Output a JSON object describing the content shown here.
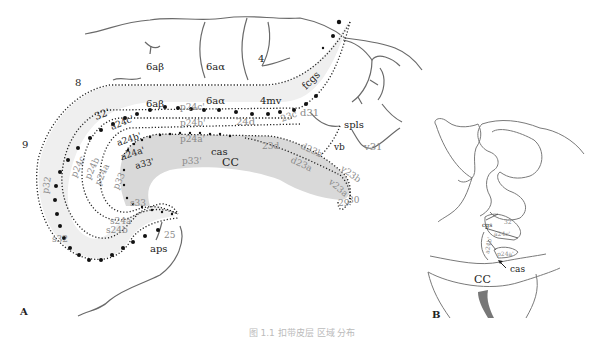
{
  "figure": {
    "panels": {
      "A": {
        "label": "A"
      },
      "B": {
        "label": "B"
      }
    },
    "colors": {
      "outline": "#6a6a6a",
      "dotted_border": "#222222",
      "shade_band": "#efefef",
      "cc_fill": "#d9d9d9",
      "dark_label": "#222222",
      "gray_label": "#8a8a8a",
      "ventricle": "#777777"
    },
    "panel_a_labels": {
      "area_8": "8",
      "area_9": "9",
      "area_6ab_top": "6aβ",
      "area_6aa_top": "6aα",
      "area_4": "4",
      "area_6ab_band": "6aβ",
      "area_6aa_band": "6aα",
      "area_4mv": "4mv",
      "fcgs": "fcgs",
      "area_32p": "32'",
      "a24c": "a24c'",
      "a24b": "a24b'",
      "a24a": "a24a'",
      "a33": "a33'",
      "p24c": "p24c'",
      "p24b": "p24b'",
      "p24a": "p24a'",
      "p33": "p33'",
      "area_24d": "24d",
      "area_23c": "23c",
      "area_23d": "23d",
      "d23b": "d23b",
      "d23a": "d23a",
      "v23b": "v23b",
      "v23a": "v23a",
      "area_29": "29",
      "area_30": "30",
      "d31": "d31",
      "v31": "v31",
      "spls": "spls",
      "vb": "vb",
      "cas": "cas",
      "cc": "CC",
      "p32": "p32",
      "p24c_v": "p24c",
      "p24b_v": "p24b",
      "p24a_v": "p24a",
      "p33_v": "p33",
      "s33": "s33",
      "s24a": "s24a",
      "s24b": "s24b",
      "s32": "s32",
      "area_25": "25",
      "aps": "aps"
    },
    "panel_b_labels": {
      "cgs": "cgs",
      "area_32p": "32'",
      "a24c": "a24c'",
      "a24b": "a24b'",
      "p24a": "p24a'",
      "cas": "cas",
      "cc": "CC"
    },
    "caption": "图 1.1  扣带皮层 区域 分布"
  }
}
